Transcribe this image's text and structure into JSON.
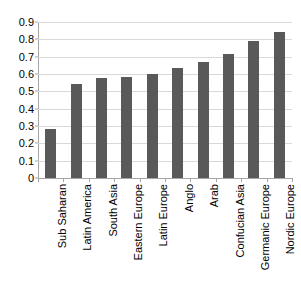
{
  "chart_data": {
    "type": "bar",
    "title": "",
    "subtitle": "",
    "xlabel": "",
    "ylabel": "",
    "ylim": [
      0,
      0.9
    ],
    "yticks": [
      "0",
      "0.1",
      "0.2",
      "0.3",
      "0.4",
      "0.5",
      "0.6",
      "0.7",
      "0.8",
      "0.9"
    ],
    "ytick_values": [
      0,
      0.1,
      0.2,
      0.3,
      0.4,
      0.5,
      0.6,
      0.7,
      0.8,
      0.9
    ],
    "grid": "horizontal",
    "legend": "none",
    "orientation": "vertical",
    "bar_color": "#595959",
    "gridline_color": "#d9d9d9",
    "axis_color": "#a6a6a6",
    "background_color": "#ffffff",
    "xtick_label_rotation": 90,
    "categories": [
      "Sub Saharan",
      "Latin America",
      "South Asia",
      "Eastern Europe",
      "Latin Europe",
      "Anglo",
      "Arab",
      "Confucian Asia",
      "Germanic Europe",
      "Nordic Europe"
    ],
    "values": [
      0.28,
      0.54,
      0.575,
      0.585,
      0.6,
      0.635,
      0.67,
      0.715,
      0.79,
      0.84
    ],
    "series": [
      {
        "name": "",
        "values": [
          0.28,
          0.54,
          0.575,
          0.585,
          0.6,
          0.635,
          0.67,
          0.715,
          0.79,
          0.84
        ]
      }
    ]
  }
}
